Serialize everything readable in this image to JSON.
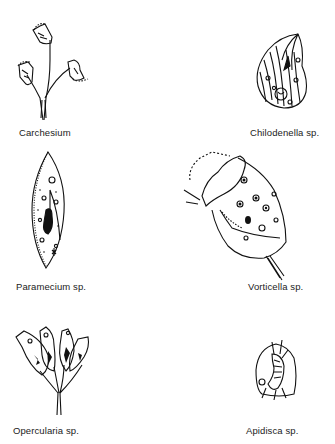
{
  "figure": {
    "organisms": [
      {
        "name": "Carchesium",
        "label": "Carchesium",
        "position": "top-left"
      },
      {
        "name": "Chilodenella sp.",
        "label": "Chilodenella sp.",
        "position": "top-right"
      },
      {
        "name": "Paramecium sp.",
        "label": "Paramecium sp.",
        "position": "middle-left"
      },
      {
        "name": "Vorticella sp.",
        "label": "Vorticella sp.",
        "position": "middle-right"
      },
      {
        "name": "Opercularia sp.",
        "label": "Opercularia sp.",
        "position": "bottom-left"
      },
      {
        "name": "Apidisca sp.",
        "label": "Apidisca sp.",
        "position": "bottom-right"
      }
    ]
  },
  "colors": {
    "ink": "#111111",
    "background": "#ffffff"
  }
}
